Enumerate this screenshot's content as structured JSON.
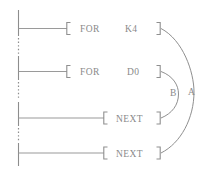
{
  "diagram": {
    "line_color": "#8d8d8d",
    "text_color": "#8a8a8a",
    "background_color": "#ffffff"
  },
  "rungs": [
    {
      "id": "rung-for-k4",
      "instruction": "FOR",
      "operand": "K4",
      "open_bracket": "[",
      "close_bracket": "]"
    },
    {
      "id": "rung-for-d0",
      "instruction": "FOR",
      "operand": "D0",
      "open_bracket": "[",
      "close_bracket": "]"
    },
    {
      "id": "rung-next-inner",
      "instruction": "NEXT",
      "operand": "",
      "open_bracket": "[",
      "close_bracket": "]"
    },
    {
      "id": "rung-next-outer",
      "instruction": "NEXT",
      "operand": "",
      "open_bracket": "[",
      "close_bracket": "]"
    }
  ],
  "loop_arcs": [
    {
      "id": "loop-arc-a",
      "label": "A",
      "from": "rung-for-k4",
      "to": "rung-next-outer"
    },
    {
      "id": "loop-arc-b",
      "label": "B",
      "from": "rung-for-d0",
      "to": "rung-next-inner"
    }
  ]
}
